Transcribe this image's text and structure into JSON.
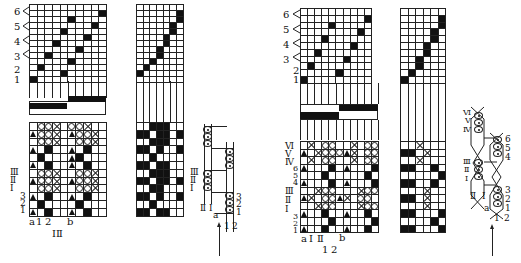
{
  "figure_left": {
    "threading_labels": [
      "6",
      "5",
      "4",
      "3",
      "2",
      "1"
    ],
    "lift_labels_roman": [
      "Ⅲ",
      "Ⅱ",
      "Ⅰ"
    ],
    "lift_labels_arabic": [
      "3",
      "2",
      "1"
    ],
    "bottom_labels": {
      "a": "a",
      "one": "1",
      "two": "2",
      "b": "b",
      "roman": "ⅠⅡ"
    },
    "side_labels": {
      "roman": [
        "Ⅲ",
        "Ⅱ",
        "Ⅰ"
      ],
      "arabic": [
        "3",
        "2",
        "1"
      ],
      "bottom_roman": [
        "Ⅱ",
        "Ⅰ"
      ],
      "a": "a",
      "bottom_arabic": [
        "1",
        "2"
      ]
    },
    "threading_grid": [
      "0000000000",
      "0000000001",
      "0000010000",
      "0000000010",
      "0000100000",
      "0000000100",
      "0001000000",
      "0000001000",
      "0010000000",
      "0000010000",
      "0100000000",
      "0000100000",
      "1000000000"
    ],
    "weave_grid": [
      "0oox0oox00",
      "toox0toox0",
      "0oox00oox0",
      "t0f00t0f00",
      "0f000tf000",
      "t0f00t0f00",
      "0oox00oox0",
      "toox0toox0",
      "0oox00oox0",
      "t0f00t0f00",
      "0f0000f000",
      "t0f00t0f00"
    ],
    "tieup_grid": [
      "0000000",
      "0000001",
      "0000001",
      "0000010",
      "0000010",
      "0000100",
      "0000100",
      "0001000",
      "0001000",
      "0010000",
      "0100000",
      "1000000",
      "0000000"
    ],
    "treadle_grid": [
      "00fff00",
      "ff0ff0f",
      "00fff00",
      "ff0f00f",
      "00f0000",
      "ff0ff00",
      "00fff00",
      "ff0ff0f",
      "00ff000",
      "ff0f00f",
      "00f0000",
      "ff0ff00"
    ]
  },
  "figure_right": {
    "threading_labels": [
      "6",
      "5",
      "4",
      "3",
      "2",
      "1"
    ],
    "lift_labels_roman": [
      "Ⅵ",
      "Ⅴ",
      "Ⅳ",
      "Ⅲ",
      "Ⅱ",
      "Ⅰ"
    ],
    "lift_labels_arabic": [
      "6",
      "5",
      "4",
      "3",
      "2",
      "1"
    ],
    "bottom_labels": {
      "a": "a",
      "one_roman": "Ⅰ",
      "two_roman": "Ⅱ",
      "b": "b",
      "one": "1",
      "two": "2"
    },
    "side_labels": {
      "roman": [
        "Ⅵ",
        "Ⅴ",
        "Ⅳ",
        "Ⅲ",
        "Ⅱ",
        "Ⅰ"
      ],
      "arabic": [
        "6",
        "5",
        "4",
        "3",
        "2",
        "1"
      ],
      "bottom_roman": [
        "Ⅱ",
        "Ⅰ"
      ],
      "a": "a",
      "bottom_arabic": [
        "1",
        "2"
      ]
    },
    "threading_grid": [
      "0000000000",
      "0000000001",
      "0000100000",
      "0000000010",
      "0003000000",
      "0000000100",
      "0010000000",
      "0000001000",
      "0100000000",
      "0000010000",
      "1000000000"
    ],
    "weave_grid": [
      "0x0oo00x0oo",
      "t0xooo tx0oo",
      "0x0oo00x0oo",
      "t000f0t000f",
      "000f00000f0",
      "t000f0t000f",
      "00xoo000xoo",
      "tx0ootx0oo0",
      "00xoo000xoo",
      "t00f00t00f0",
      "0000f00000f",
      "t00f00t00f0"
    ],
    "treadle_grid": [
      "00x000",
      "ff0x00",
      "00x000",
      "ff00f0",
      "00000f",
      "ff00f0",
      "000x00",
      "ff0x00",
      "000x00",
      "ff000f",
      "0000f0",
      "ff000f"
    ]
  },
  "colors": {
    "ink": "#111111",
    "paper": "#ffffff"
  }
}
